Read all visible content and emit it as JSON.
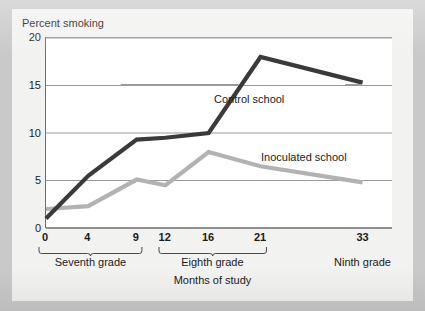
{
  "chart_data": {
    "type": "line",
    "title": "",
    "xlabel": "Months of study",
    "ylabel": "Percent smoking",
    "x": [
      0,
      4,
      9,
      12,
      16,
      21,
      33
    ],
    "xtick_labels": [
      "0",
      "4",
      "9",
      "12",
      "16",
      "21",
      "33"
    ],
    "ytick_labels": [
      "0",
      "5",
      "10",
      "15",
      "20"
    ],
    "ytick_values": [
      0,
      5,
      10,
      15,
      20
    ],
    "ylim": [
      0,
      20
    ],
    "grid": "horizontal",
    "legend_position": "inline-annotations",
    "series": [
      {
        "name": "Control school",
        "color": "#3a3a3a",
        "values": [
          1.0,
          5.5,
          9.3,
          9.5,
          10.0,
          18.0,
          15.3
        ]
      },
      {
        "name": "Inoculated school",
        "color": "#b2b2b2",
        "values": [
          2.0,
          2.3,
          5.1,
          4.5,
          8.0,
          6.5,
          4.8
        ]
      }
    ],
    "annotations": [
      {
        "text": "Control school",
        "has_leader_lines": true
      },
      {
        "text": "Inoculated school",
        "has_leader_lines": false
      }
    ],
    "grade_groups": [
      {
        "label": "Seventh grade",
        "from_x": 0,
        "to_x": 9
      },
      {
        "label": "Eighth grade",
        "from_x": 12,
        "to_x": 21
      },
      {
        "label": "Ninth grade",
        "from_x": 33,
        "to_x": 33
      }
    ]
  },
  "colors": {
    "frame_background": "#c9c9c9",
    "card_background": "#f2f2f1",
    "plot_background": "#ffffff",
    "gridline": "#9a9a9a",
    "axis": "#6d6d6d",
    "text": "#1b1b1b",
    "control_series": "#3a3a3a",
    "inoculated_series": "#b2b2b2"
  }
}
